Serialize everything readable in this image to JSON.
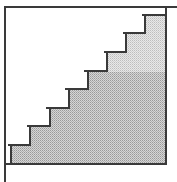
{
  "diagram": {
    "type": "staircase",
    "step_count": 8,
    "colors": {
      "line": "#3a3a3a",
      "fill_dark": "#c8c8c8",
      "fill_light": "#dedede",
      "background": "#ffffff"
    },
    "frame": {
      "left": 5,
      "top": 6,
      "right": 167,
      "bottom": 164
    },
    "steps": [
      {
        "x": 11,
        "y": 145
      },
      {
        "x": 30,
        "y": 126
      },
      {
        "x": 50,
        "y": 108
      },
      {
        "x": 69,
        "y": 89
      },
      {
        "x": 88,
        "y": 71
      },
      {
        "x": 107,
        "y": 52
      },
      {
        "x": 126,
        "y": 33
      },
      {
        "x": 145,
        "y": 15
      }
    ],
    "shade_split_y": 72
  }
}
